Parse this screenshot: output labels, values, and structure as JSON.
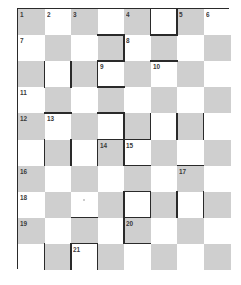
{
  "puzzle": {
    "type": "barred-crossword",
    "rows": 10,
    "cols": 8,
    "colors": {
      "shade": "#cfcfcf",
      "light": "#ffffff",
      "bar": "#2a2a2a",
      "number": "#3a3a3a"
    },
    "numbers": [
      {
        "r": 0,
        "c": 0,
        "n": "1"
      },
      {
        "r": 0,
        "c": 1,
        "n": "2"
      },
      {
        "r": 0,
        "c": 2,
        "n": "3"
      },
      {
        "r": 0,
        "c": 4,
        "n": "4"
      },
      {
        "r": 0,
        "c": 6,
        "n": "5"
      },
      {
        "r": 0,
        "c": 7,
        "n": "6"
      },
      {
        "r": 1,
        "c": 0,
        "n": "7"
      },
      {
        "r": 1,
        "c": 4,
        "n": "8"
      },
      {
        "r": 2,
        "c": 3,
        "n": "9"
      },
      {
        "r": 2,
        "c": 5,
        "n": "10"
      },
      {
        "r": 3,
        "c": 0,
        "n": "11"
      },
      {
        "r": 4,
        "c": 0,
        "n": "12"
      },
      {
        "r": 4,
        "c": 1,
        "n": "13"
      },
      {
        "r": 5,
        "c": 3,
        "n": "14"
      },
      {
        "r": 5,
        "c": 4,
        "n": "15"
      },
      {
        "r": 6,
        "c": 0,
        "n": "16"
      },
      {
        "r": 6,
        "c": 6,
        "n": "17"
      },
      {
        "r": 7,
        "c": 0,
        "n": "18"
      },
      {
        "r": 8,
        "c": 0,
        "n": "19"
      },
      {
        "r": 8,
        "c": 4,
        "n": "20"
      },
      {
        "r": 9,
        "c": 2,
        "n": "21"
      }
    ],
    "bars": {
      "vertical": [
        {
          "r": 0,
          "line": 5
        },
        {
          "r": 0,
          "line": 6
        },
        {
          "r": 1,
          "line": 4
        },
        {
          "r": 2,
          "line": 1
        },
        {
          "r": 2,
          "line": 2
        },
        {
          "r": 2,
          "line": 3
        },
        {
          "r": 4,
          "line": 4
        },
        {
          "r": 4,
          "line": 5
        },
        {
          "r": 4,
          "line": 6
        },
        {
          "r": 4,
          "line": 7
        },
        {
          "r": 5,
          "line": 1
        },
        {
          "r": 5,
          "line": 2
        },
        {
          "r": 5,
          "line": 3
        },
        {
          "r": 5,
          "line": 4
        },
        {
          "r": 7,
          "line": 4
        },
        {
          "r": 7,
          "line": 5
        },
        {
          "r": 7,
          "line": 6
        },
        {
          "r": 7,
          "line": 7
        },
        {
          "r": 8,
          "line": 4
        },
        {
          "r": 9,
          "line": 1
        },
        {
          "r": 9,
          "line": 2
        },
        {
          "r": 9,
          "line": 3
        }
      ],
      "horizontal": [
        {
          "c": 5,
          "line": 1
        },
        {
          "c": 3,
          "line": 1
        },
        {
          "c": 5,
          "line": 2
        },
        {
          "c": 3,
          "line": 2
        },
        {
          "c": 3,
          "line": 3
        },
        {
          "c": 1,
          "line": 4
        },
        {
          "c": 3,
          "line": 4
        },
        {
          "c": 4,
          "line": 5
        },
        {
          "c": 3,
          "line": 5
        },
        {
          "c": 4,
          "line": 6
        },
        {
          "c": 6,
          "line": 6
        },
        {
          "c": 4,
          "line": 7
        },
        {
          "c": 2,
          "line": 8
        },
        {
          "c": 4,
          "line": 8
        },
        {
          "c": 4,
          "line": 9
        },
        {
          "c": 2,
          "line": 9
        }
      ]
    },
    "marks": [
      {
        "r": 7,
        "c": 2
      }
    ]
  }
}
